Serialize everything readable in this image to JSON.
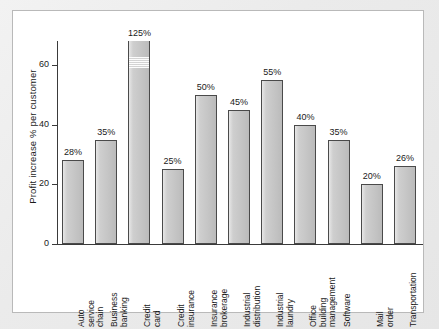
{
  "chart_data": {
    "type": "bar",
    "title": "",
    "subtitle": "",
    "xlabel": "",
    "ylabel": "Profit increase % per customer",
    "ylim": [
      0,
      68
    ],
    "yticks": [
      0,
      20,
      40,
      60
    ],
    "ytick_labels": [
      "0",
      "20",
      "40",
      "60"
    ],
    "grid": false,
    "legend": null,
    "note": "The Credit card bar is truncated with an axis-break band; its true value is 125%.",
    "categories": [
      "Auto service chain",
      "Business banking",
      "Credit card",
      "Credit insurance",
      "Insurance brokerage",
      "Industrial distribution",
      "Industrial laundry",
      "Office building management",
      "Software",
      "Mail order",
      "Transportation"
    ],
    "category_lines": [
      [
        "Auto",
        "service",
        "chain"
      ],
      [
        "Business",
        "banking"
      ],
      [
        "Credit",
        "card"
      ],
      [
        "Credit",
        "insurance"
      ],
      [
        "Insurance",
        "brokerage"
      ],
      [
        "Industrial",
        "distribution"
      ],
      [
        "Industrial",
        "laundry"
      ],
      [
        "Office",
        "building",
        "management"
      ],
      [
        "Software"
      ],
      [
        "Mail",
        "order"
      ],
      [
        "Transportation"
      ]
    ],
    "values": [
      28,
      35,
      125,
      25,
      50,
      45,
      55,
      40,
      35,
      20,
      26
    ],
    "value_labels": [
      "28%",
      "35%",
      "125%",
      "25%",
      "50%",
      "45%",
      "55%",
      "40%",
      "35%",
      "20%",
      "26%"
    ],
    "drawn_values": [
      28,
      35,
      68,
      25,
      50,
      45,
      55,
      40,
      35,
      20,
      26
    ]
  },
  "style": {
    "bar_fill": "#c9c9c9",
    "bar_stroke": "#4a4a4a",
    "axis_color": "#3a3a3a",
    "text_color": "#1a1a1a",
    "panel_background": "#ffffff",
    "figure_background": "#ececec",
    "panel_border": "#b9b9b9"
  }
}
